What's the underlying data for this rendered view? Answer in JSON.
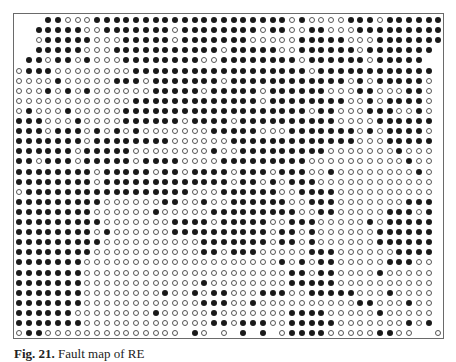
{
  "figure": {
    "caption_label": "Fig. 21.",
    "caption_text": "Fault map of RE",
    "legend": {
      "filled": "filled-dot",
      "hollow": "hollow-dot",
      "empty": "no-dot"
    },
    "grid": {
      "cols": 44,
      "rows": 32,
      "origin_x": 5,
      "origin_y": 6,
      "step_x": 9.75,
      "step_y": 10.1,
      "colors": {
        "filled": "#1a1a1a",
        "hollow_border": "#555555",
        "frame": "#6a6a6a"
      },
      "data": [
        "---11000111111111111111111110100001110111111",
        "--111110011111110111111110110011000111111111",
        "--0111110001111101111111000001111100011111110",
        "--11111000111111111110111110011111101111111",
        "-11011010001111111100111111110111111011111",
        "0111000000001111111111111111110111111111111",
        "0000100000111011111110111111111111010111110",
        "0001010100000011111011111011111100011000110",
        "0000000000001111111111111011111111001011110",
        "0100010000011111111111111111110110001110010",
        "1110001000011111101111011111111110000111111",
        "1110111010101000000011111000111111101011110",
        "1111111011111111000000111111111111100011111",
        "1111110111110000000010011111111100000001000",
        "1101110111110111100001111111110000000000100",
        "1111111101111101101111011101110010000000010",
        "1111111101111111111111011010111000000000000",
        "0111111111111111110001111110011110000000000",
        "1111111110000001100100111111001110000000111",
        "1111111100000010000011111111100110000011101",
        "1111111110000000111101111100111000001011111",
        "1111111101000000111111111101101000000111111",
        "1111111110000000000111111101101000000111111",
        "1111111100000000000110111000001110000001111",
        "1111111000000000000000000001010110000011100",
        "1111111000000000000000000000110110000100000",
        "1111111000000000000100000000111110000000000",
        "1111111000000001001011000111001111100010000",
        "1111111000000000000111001000000000011000100",
        "1111110000000010000010000000111100000100000",
        "1111111000000000000011011100111110000000101",
        "01100000000000000-10-0-1-1-01111000001100--0101"
      ]
    }
  }
}
